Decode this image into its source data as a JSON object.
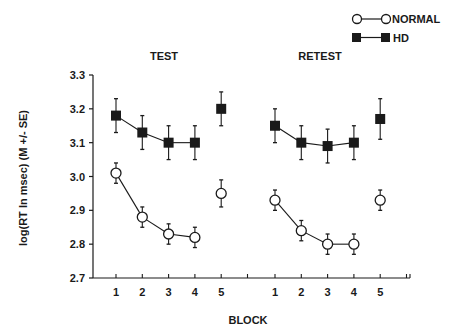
{
  "chart_data": {
    "type": "line",
    "title": "",
    "panels": [
      {
        "label": "TEST",
        "categories": [
          "1",
          "2",
          "3",
          "4",
          "5"
        ],
        "series": [
          {
            "name": "NORMAL",
            "marker": "open-circle",
            "values": [
              3.01,
              2.88,
              2.83,
              2.82,
              2.95
            ],
            "se": [
              0.03,
              0.03,
              0.03,
              0.03,
              0.04
            ],
            "connected": [
              true,
              true,
              true,
              true,
              false
            ]
          },
          {
            "name": "HD",
            "marker": "filled-square",
            "values": [
              3.18,
              3.13,
              3.1,
              3.1,
              3.2
            ],
            "se": [
              0.05,
              0.05,
              0.05,
              0.05,
              0.05
            ],
            "connected": [
              true,
              true,
              true,
              true,
              false
            ]
          }
        ]
      },
      {
        "label": "RETEST",
        "categories": [
          "1",
          "2",
          "3",
          "4",
          "5"
        ],
        "series": [
          {
            "name": "NORMAL",
            "marker": "open-circle",
            "values": [
              2.93,
              2.84,
              2.8,
              2.8,
              2.93
            ],
            "se": [
              0.03,
              0.03,
              0.03,
              0.03,
              0.03
            ],
            "connected": [
              true,
              true,
              true,
              true,
              false
            ]
          },
          {
            "name": "HD",
            "marker": "filled-square",
            "values": [
              3.15,
              3.1,
              3.09,
              3.1,
              3.17
            ],
            "se": [
              0.05,
              0.05,
              0.05,
              0.05,
              0.06
            ],
            "connected": [
              true,
              true,
              true,
              true,
              false
            ]
          }
        ]
      }
    ],
    "xlabel": "BLOCK",
    "ylabel": "log(RT In msec) (M +/- SE)",
    "ylim": [
      2.7,
      3.3
    ],
    "yticks": [
      "2.7",
      "2.8",
      "2.9",
      "3.0",
      "3.1",
      "3.2",
      "3.3"
    ],
    "grid": false,
    "legend": {
      "position": "top-right",
      "entries": [
        "NORMAL",
        "HD"
      ]
    }
  },
  "legend": {
    "normal_label": "NORMAL",
    "hd_label": "HD"
  },
  "panels": {
    "test_label": "TEST",
    "retest_label": "RETEST"
  },
  "axes": {
    "xlabel": "BLOCK",
    "ylabel": "log(RT In msec) (M +/- SE)"
  }
}
